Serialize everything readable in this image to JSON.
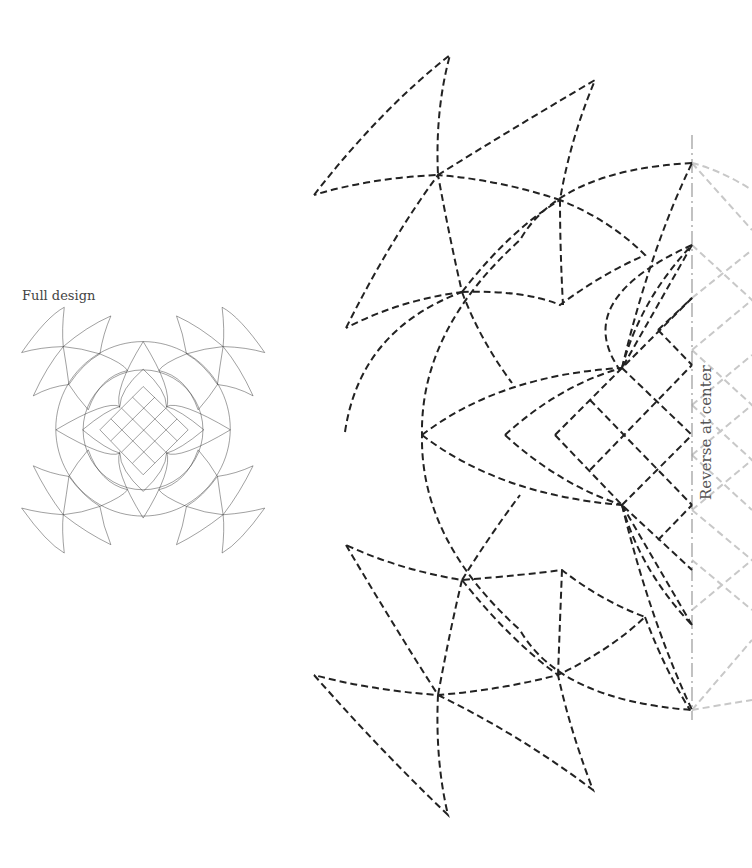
{
  "labels": {
    "full_design": "Full design",
    "reverse_at_center": "Reverse at center"
  },
  "colors": {
    "line": "#222222",
    "ghost_line": "#c8c8c8",
    "center_line": "#999999",
    "background": "#ffffff"
  },
  "main_design": {
    "center_line": {
      "x": 692,
      "y1": 135,
      "y2": 720
    },
    "outer_circle": {
      "cx": 692,
      "cy": 428,
      "r": 270
    },
    "inner_circle_point": {
      "x": 505,
      "y": 435
    }
  }
}
